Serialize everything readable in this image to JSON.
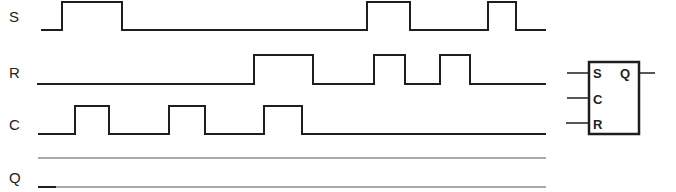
{
  "diagram": {
    "type": "timing-diagram",
    "signals": [
      {
        "name": "S",
        "label_y": 22,
        "high_y": 2,
        "low_y": 30,
        "start_x": 41,
        "end_x": 546,
        "pulses": [
          [
            62,
            122
          ],
          [
            367,
            410
          ],
          [
            488,
            516
          ]
        ]
      },
      {
        "name": "R",
        "label_y": 78,
        "high_y": 55,
        "low_y": 84,
        "start_x": 37,
        "end_x": 546,
        "pulses": [
          [
            254,
            313
          ],
          [
            374,
            405
          ],
          [
            440,
            470
          ]
        ]
      },
      {
        "name": "C",
        "label_y": 130,
        "high_y": 106,
        "low_y": 134,
        "start_x": 38,
        "end_x": 546,
        "pulses": [
          [
            75,
            109
          ],
          [
            169,
            205
          ],
          [
            264,
            302
          ]
        ]
      },
      {
        "name": "Q",
        "label_y": 183,
        "undetermined": true,
        "upper_y": 158,
        "lower_y": 187,
        "start_x": 38,
        "end_x": 546,
        "initial_bold_end_x": 56
      }
    ],
    "flip_flop": {
      "inputs": [
        "S",
        "C",
        "R"
      ],
      "output": "Q"
    }
  }
}
